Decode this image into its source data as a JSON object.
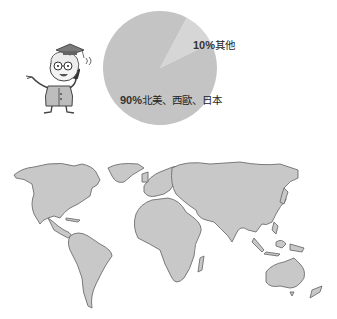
{
  "chart_data": {
    "type": "pie",
    "title": "",
    "slices": [
      {
        "label": "北美、西歐、日本",
        "value": 90,
        "display": "90%",
        "color": "#c4c4c4"
      },
      {
        "label": "其他",
        "value": 10,
        "display": "10%",
        "color": "#d6d6d6"
      }
    ],
    "start_angle_deg": 28,
    "legend": "none",
    "labels_inside": true
  },
  "labels": {
    "small_pct": "10%",
    "small_text": "其他",
    "large_pct": "90%",
    "large_text": "北美、西歐、日本"
  },
  "illustration": {
    "character": "cartoon-professor-with-phone",
    "map": "world-map-grey"
  },
  "colors": {
    "pie_major": "#c4c4c4",
    "pie_minor": "#d6d6d6",
    "map_fill": "#c8c8c8",
    "map_stroke": "#6e6e6e"
  }
}
